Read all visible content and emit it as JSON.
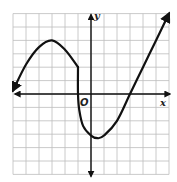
{
  "chart_data": {
    "type": "line",
    "title": "",
    "xlabel": "x",
    "ylabel": "y",
    "origin_label": "O",
    "xlim": [
      -6,
      6
    ],
    "ylim": [
      -6,
      6
    ],
    "grid": true,
    "grid_step": 1,
    "tick_labels_shown": false,
    "series": [
      {
        "name": "f(x)",
        "piece": "left",
        "description": "arrow toward lower-left, rises to max at (-3,4), falls to (-1,2)",
        "x": [
          -6,
          -5,
          -4,
          -3,
          -2,
          -1
        ],
        "y": [
          0.25,
          2.2,
          3.5,
          4,
          3.3,
          2
        ],
        "arrow_start": true
      },
      {
        "name": "f(x)",
        "piece": "right",
        "description": "vertical drop at x=-1 from (-1,2) to about (-1,0), continues down to min near (0.5,-3.3), rises through (3,0) with arrow to upper-right at (6,6)",
        "x": [
          -1,
          -1,
          -0.9,
          -0.6,
          0,
          0.5,
          1,
          2,
          3,
          4,
          5,
          6
        ],
        "y": [
          2,
          0,
          -1.2,
          -2.4,
          -3.1,
          -3.3,
          -3.1,
          -2,
          0,
          2,
          4,
          6
        ],
        "arrow_end": true
      }
    ],
    "key_points": {
      "local_max": [
        -3,
        4
      ],
      "jump_x": -1,
      "local_min": [
        0.5,
        -3.3
      ],
      "x_intercepts": [
        -1,
        3
      ]
    }
  },
  "colors": {
    "curve": "#111111",
    "axis": "#111111",
    "grid": "#bdbdbd",
    "background": "#ffffff"
  }
}
